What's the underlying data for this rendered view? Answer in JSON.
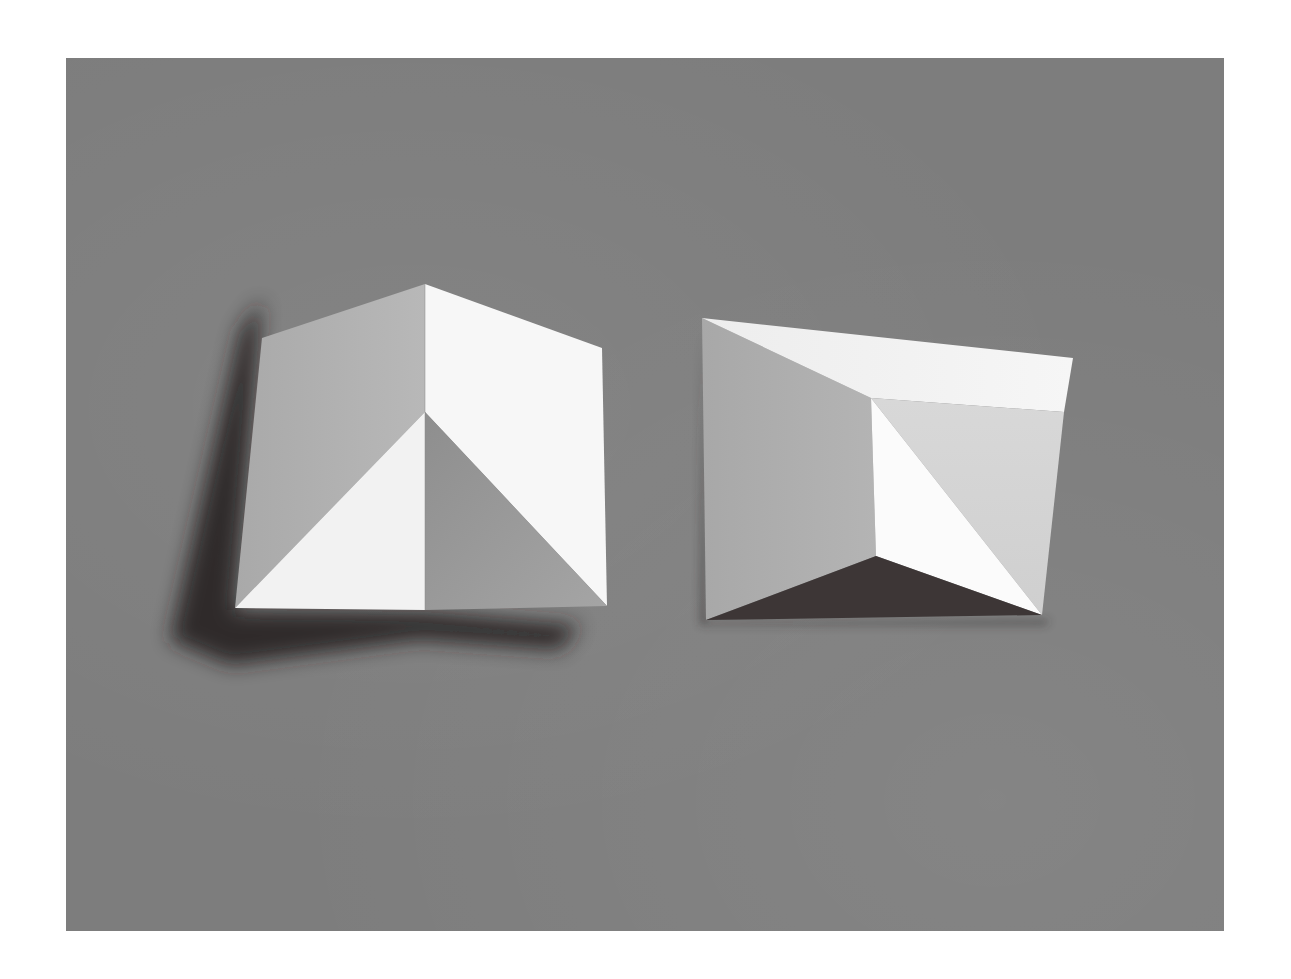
{
  "image": {
    "description": "Photograph of two folded white paper forms on a gray background",
    "background_color": "#7d7d7d",
    "page_color": "#ffffff"
  },
  "objects": [
    {
      "name": "left-folded-paper",
      "description": "Paper folded into a tent-like form with a central diagonal crease, casting a shadow to the lower left",
      "colors": {
        "lit": "#f4f4f4",
        "bright": "#fafafa",
        "mid": "#b9b9b9",
        "shade": "#9a9a9a",
        "shadow": "#2e2a2a"
      }
    },
    {
      "name": "right-folded-paper",
      "description": "Paper folded with a recessed inner triangle and a dark lower wedge",
      "colors": {
        "lit": "#f2f2f2",
        "bright": "#fbfbfb",
        "mid": "#b6b6b6",
        "light_mid": "#d5d5d5",
        "shadow": "#3a3434"
      }
    }
  ]
}
